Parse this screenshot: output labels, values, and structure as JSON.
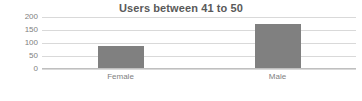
{
  "chart_data": {
    "type": "bar",
    "title": "Users between 41 to 50",
    "categories": [
      "Female",
      "Male"
    ],
    "values": [
      90,
      175
    ],
    "series": [
      {
        "name": "Users",
        "values": [
          90,
          175
        ],
        "color": "#808080"
      }
    ],
    "xlabel": "",
    "ylabel": "",
    "ylim": [
      0,
      200
    ],
    "ytick_step": 50,
    "yticks": [
      0,
      50,
      100,
      150,
      200
    ],
    "ytick_labels": [
      "0",
      "50",
      "100",
      "150",
      "200"
    ],
    "grid": true,
    "legend": false,
    "legend_position": "none",
    "background_color": "#ffffff",
    "gridline_color": "#d9d9d9",
    "text_color": "#808080",
    "title_color": "#595959"
  }
}
